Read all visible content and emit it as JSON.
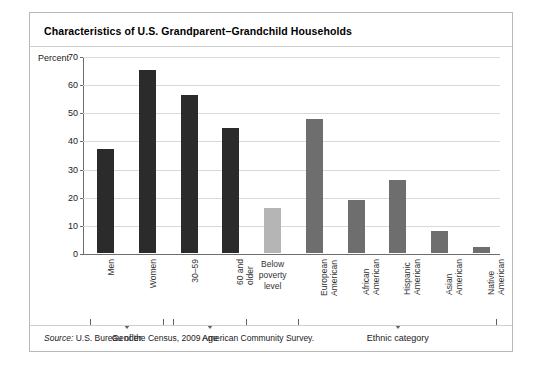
{
  "figure": {
    "title": "Characteristics of U.S. Grandparent–Grandchild Households",
    "source_word": "Source:",
    "source_text": " U.S. Bureau of the Census, 2009 American Community Survey."
  },
  "chart_data": {
    "type": "bar",
    "title": "Characteristics of U.S. Grandparent–Grandchild Households",
    "xlabel": "",
    "ylabel": "Percent",
    "ylim": [
      0,
      70
    ],
    "yticks": [
      0,
      10,
      20,
      30,
      40,
      50,
      60,
      70
    ],
    "ytick_labels": [
      "0",
      "10",
      "20",
      "30",
      "40",
      "50",
      "60",
      "70"
    ],
    "grid": true,
    "legend": "none",
    "categories": [
      "Men",
      "Women",
      "30–59",
      "60 and older",
      "Below poverty level",
      "European American",
      "African American",
      "Hispanic American",
      "Asian American",
      "Native American"
    ],
    "values": [
      37,
      65,
      56,
      44.5,
      16,
      47.5,
      19,
      26,
      8,
      2
    ],
    "bar_colors": [
      "#2b2b2b",
      "#2b2b2b",
      "#2b2b2b",
      "#2b2b2b",
      "#b5b5b5",
      "#6e6e6e",
      "#6e6e6e",
      "#6e6e6e",
      "#6e6e6e",
      "#6e6e6e"
    ],
    "groups": [
      {
        "label": "Gender",
        "start": 0,
        "end": 1
      },
      {
        "label": "Age",
        "start": 2,
        "end": 3
      },
      {
        "label": "Ethnic category",
        "start": 5,
        "end": 9
      }
    ]
  },
  "colors": {
    "dark_bar": "#2b2b2b",
    "mid_bar": "#6e6e6e",
    "light_bar": "#b5b5b5",
    "gridline": "#d9d9d9",
    "axis": "#6d6d6d",
    "frame": "#b9b9b9"
  }
}
